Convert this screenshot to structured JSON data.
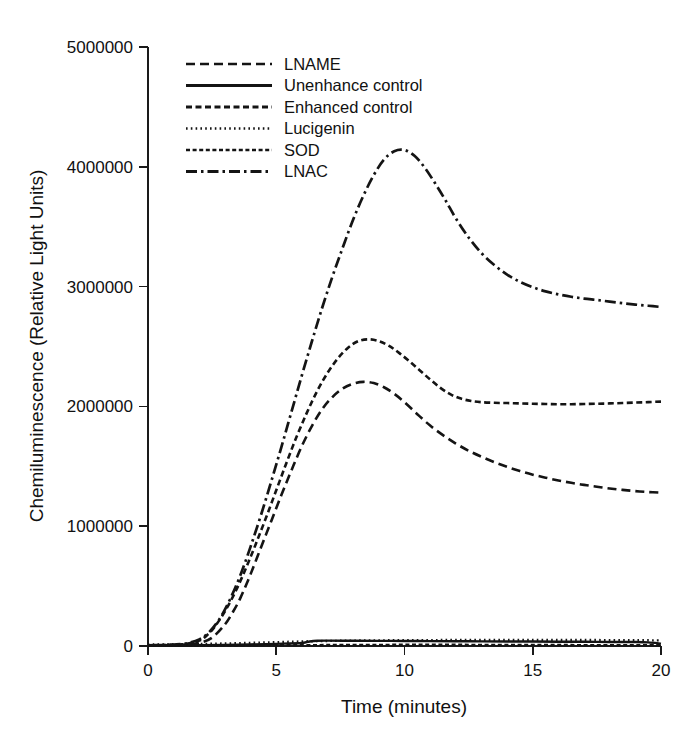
{
  "chart_data": {
    "type": "line",
    "title": "",
    "xlabel": "Time (minutes)",
    "ylabel": "Chemiluminescence (Relative Light Units)",
    "xlim": [
      0,
      20
    ],
    "ylim": [
      0,
      5000000
    ],
    "xticks": [
      0,
      5,
      10,
      15,
      20
    ],
    "xtick_labels": [
      "0",
      "5",
      "10",
      "15",
      "20"
    ],
    "yticks": [
      0,
      1000000,
      2000000,
      3000000,
      4000000,
      5000000
    ],
    "ytick_labels": [
      "0",
      "1000000",
      "2000000",
      "3000000",
      "4000000",
      "5000000"
    ],
    "grid": false,
    "legend_position": "upper-left-inside",
    "series": [
      {
        "name": "LNAME",
        "style": "dashed",
        "dasharray": "9,5",
        "width": 2.6,
        "color": "#141414",
        "x": [
          0,
          0.5,
          1,
          1.5,
          2,
          2.5,
          3,
          3.3,
          3.6,
          4,
          4.4,
          4.8,
          5.2,
          5.6,
          6,
          6.4,
          6.8,
          7.2,
          7.6,
          8,
          8.4,
          8.8,
          9.2,
          9.6,
          10,
          10.5,
          11,
          11.5,
          12,
          12.5,
          13,
          13.5,
          14,
          14.5,
          15,
          15.5,
          16,
          16.5,
          17,
          17.5,
          18,
          18.5,
          19,
          19.5,
          20
        ],
        "y": [
          5000,
          6000,
          8000,
          12000,
          25000,
          70000,
          180000,
          280000,
          400000,
          600000,
          820000,
          1040000,
          1260000,
          1470000,
          1670000,
          1840000,
          1980000,
          2080000,
          2150000,
          2190000,
          2205000,
          2195000,
          2160000,
          2105000,
          2035000,
          1935000,
          1840000,
          1760000,
          1690000,
          1630000,
          1580000,
          1535000,
          1495000,
          1460000,
          1430000,
          1405000,
          1382000,
          1362000,
          1345000,
          1330000,
          1315000,
          1303000,
          1293000,
          1285000,
          1280000
        ]
      },
      {
        "name": "Unenhance control",
        "style": "solid",
        "dasharray": "",
        "width": 2.4,
        "color": "#141414",
        "x": [
          0,
          1,
          2,
          3,
          4,
          5,
          6,
          6.3,
          6.6,
          7,
          8,
          9,
          10,
          11,
          12,
          13,
          14,
          15,
          16,
          17,
          18,
          19,
          19.5,
          20
        ],
        "y": [
          3000,
          4000,
          6000,
          9000,
          13000,
          18000,
          25000,
          38000,
          44000,
          45000,
          44000,
          43000,
          42000,
          41000,
          40000,
          39000,
          38000,
          37000,
          36000,
          35000,
          34000,
          33000,
          30000,
          20000
        ]
      },
      {
        "name": "Enhanced control",
        "style": "dashed-fine",
        "dasharray": "6,3.5",
        "width": 2.6,
        "color": "#141414",
        "x": [
          0,
          0.5,
          1,
          1.5,
          2,
          2.3,
          2.6,
          3,
          3.4,
          3.8,
          4.2,
          4.6,
          5,
          5.4,
          5.8,
          6.2,
          6.6,
          7,
          7.4,
          7.8,
          8.2,
          8.6,
          9,
          9.4,
          9.8,
          10.2,
          10.6,
          11,
          11.4,
          11.8,
          12.2,
          12.6,
          13,
          13.5,
          14,
          14.5,
          15,
          15.5,
          16,
          16.5,
          17,
          17.5,
          18,
          18.5,
          19,
          19.5,
          20
        ],
        "y": [
          5000,
          7000,
          10000,
          18000,
          45000,
          90000,
          160000,
          290000,
          450000,
          640000,
          850000,
          1070000,
          1300000,
          1530000,
          1750000,
          1950000,
          2130000,
          2280000,
          2400000,
          2490000,
          2545000,
          2560000,
          2545000,
          2505000,
          2445000,
          2375000,
          2300000,
          2225000,
          2155000,
          2100000,
          2065000,
          2045000,
          2035000,
          2030000,
          2028000,
          2025000,
          2022000,
          2020000,
          2018000,
          2018000,
          2020000,
          2022000,
          2025000,
          2028000,
          2032000,
          2036000,
          2040000
        ]
      },
      {
        "name": "Lucigenin",
        "style": "dotted",
        "dasharray": "1.6,3.2",
        "width": 2.4,
        "color": "#141414",
        "x": [
          0,
          1,
          2,
          3,
          4,
          5,
          6,
          7,
          8,
          9,
          10,
          11,
          12,
          13,
          14,
          15,
          16,
          17,
          18,
          19,
          20
        ],
        "y": [
          12000,
          14000,
          17000,
          21000,
          26000,
          32000,
          38000,
          42000,
          45000,
          47000,
          48000,
          49000,
          50000,
          50000,
          50000,
          50000,
          50000,
          50000,
          49000,
          48000,
          47000
        ]
      },
      {
        "name": "SOD",
        "style": "dashed-short",
        "dasharray": "4,2.6",
        "width": 2.4,
        "color": "#141414",
        "x": [
          0,
          1,
          2,
          3,
          4,
          5,
          6,
          7,
          8,
          9,
          10,
          11,
          12,
          13,
          14,
          15,
          16,
          17,
          18,
          19,
          20
        ],
        "y": [
          2000,
          2500,
          3000,
          4000,
          5000,
          6000,
          7000,
          8000,
          9000,
          9500,
          10000,
          10000,
          10000,
          9500,
          9000,
          8500,
          8000,
          7500,
          7000,
          6500,
          6000
        ]
      },
      {
        "name": "LNAC",
        "style": "dash-dot",
        "dasharray": "11,4,2.5,4",
        "width": 2.7,
        "color": "#141414",
        "x": [
          0,
          0.5,
          1,
          1.5,
          2,
          2.4,
          2.8,
          3.2,
          3.6,
          4,
          4.4,
          4.8,
          5.2,
          5.6,
          6,
          6.4,
          6.8,
          7.2,
          7.6,
          8,
          8.4,
          8.8,
          9.2,
          9.6,
          10,
          10.4,
          10.8,
          11.2,
          11.6,
          12,
          12.5,
          13,
          13.5,
          14,
          14.5,
          15,
          15.5,
          16,
          16.5,
          17,
          17.5,
          18,
          18.5,
          19,
          19.5,
          20
        ],
        "y": [
          6000,
          8000,
          12000,
          22000,
          55000,
          120000,
          230000,
          390000,
          590000,
          830000,
          1090000,
          1370000,
          1660000,
          1960000,
          2260000,
          2550000,
          2830000,
          3090000,
          3330000,
          3560000,
          3760000,
          3930000,
          4060000,
          4130000,
          4140000,
          4090000,
          3990000,
          3860000,
          3720000,
          3570000,
          3410000,
          3280000,
          3180000,
          3100000,
          3040000,
          2995000,
          2960000,
          2935000,
          2915000,
          2900000,
          2888000,
          2875000,
          2862000,
          2850000,
          2840000,
          2830000
        ]
      }
    ],
    "legend_entries": [
      {
        "label": "LNAME",
        "dasharray": "9,5",
        "width": 2.6
      },
      {
        "label": "Unenhance control",
        "dasharray": "",
        "width": 3.0
      },
      {
        "label": "Enhanced control",
        "dasharray": "6,3.5",
        "width": 2.8
      },
      {
        "label": "Lucigenin",
        "dasharray": "1.6,3.2",
        "width": 2.6
      },
      {
        "label": "SOD",
        "dasharray": "4,2.6",
        "width": 2.6
      },
      {
        "label": "LNAC",
        "dasharray": "11,4,2.5,4",
        "width": 2.8
      }
    ]
  }
}
